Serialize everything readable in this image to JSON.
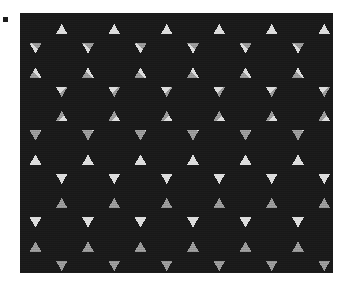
{
  "page": {
    "background_color": "#ffffff",
    "width": 345,
    "height": 281
  },
  "corner_marker": {
    "name": "registration-mark",
    "color": "#1c1c1c",
    "x": 3,
    "y": 17,
    "size": 5
  },
  "figure": {
    "x": 20,
    "y": 13,
    "width": 313,
    "height": 260,
    "background_color": "#d8d8d8"
  },
  "chart_data": {
    "type": "tiling",
    "palette": {
      "hexagon": "#1a1a1a",
      "triangle_up": "#dcdcdc",
      "triangle_down": "#9a9a9a",
      "background": "#d8d8d8"
    },
    "lattice": {
      "hex_circumradius": 30.3,
      "column_pitch": 52.5,
      "row_pitch": 43.5,
      "row_offset": 26.25,
      "origin_x": 15.5,
      "origin_y": 4.0,
      "columns": 8,
      "rows": 8
    },
    "legend": [
      {
        "label": "Hexagon",
        "color": "#1a1a1a"
      },
      {
        "label": "Upward triangle",
        "color": "#dcdcdc"
      },
      {
        "label": "Downward triangle",
        "color": "#9a9a9a"
      }
    ]
  }
}
